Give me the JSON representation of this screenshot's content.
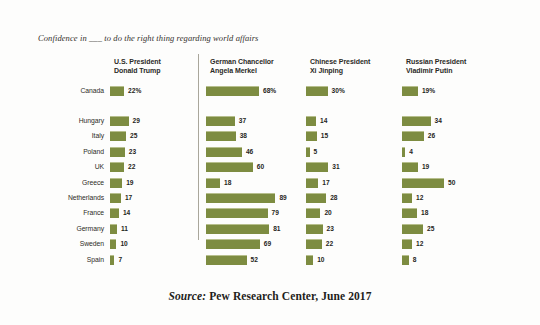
{
  "chart_data": {
    "type": "bar",
    "title": "Confidence in ___ to do the right thing regarding world affairs",
    "xlabel": "",
    "ylabel": "",
    "xlim": [
      0,
      100
    ],
    "grid": false,
    "orientation": "horizontal",
    "legend_position": "top (column headers)",
    "note": "Percent expressing confidence in each leader, by country. Values for Canada shown with % sign; remaining values are plain numbers.",
    "categories": [
      "Canada",
      "Hungary",
      "Italy",
      "Poland",
      "UK",
      "Greece",
      "Netherlands",
      "France",
      "Germany",
      "Sweden",
      "Spain"
    ],
    "series": [
      {
        "name": "U.S. President Donald Trump",
        "name_line1": "U.S. President",
        "name_line2": "Donald Trump",
        "values": [
          22,
          29,
          25,
          23,
          22,
          19,
          17,
          14,
          11,
          10,
          7
        ],
        "labels": [
          "22%",
          "29",
          "25",
          "23",
          "22",
          "19",
          "17",
          "14",
          "11",
          "10",
          "7"
        ]
      },
      {
        "name": "German Chancellor Angela Merkel",
        "name_line1": "German Chancellor",
        "name_line2": "Angela Merkel",
        "values": [
          68,
          37,
          38,
          46,
          60,
          18,
          89,
          79,
          81,
          69,
          52
        ],
        "labels": [
          "68%",
          "37",
          "38",
          "46",
          "60",
          "18",
          "89",
          "79",
          "81",
          "69",
          "52"
        ]
      },
      {
        "name": "Chinese President Xi Jinping",
        "name_line1": "Chinese President",
        "name_line2": "Xi Jinping",
        "values": [
          30,
          14,
          15,
          5,
          31,
          17,
          28,
          20,
          23,
          22,
          10
        ],
        "labels": [
          "30%",
          "14",
          "15",
          "5",
          "31",
          "17",
          "28",
          "20",
          "23",
          "22",
          "10"
        ]
      },
      {
        "name": "Russian President Vladimir Putin",
        "name_line1": "Russian President",
        "name_line2": "Vladimir Putin",
        "values": [
          19,
          34,
          26,
          4,
          19,
          50,
          12,
          18,
          25,
          12,
          8
        ],
        "labels": [
          "19%",
          "34",
          "26",
          "4",
          "19",
          "50",
          "12",
          "18",
          "25",
          "12",
          "8"
        ]
      }
    ]
  },
  "colors": {
    "bar": "#7d8c41",
    "bar_highlight": "#b7bf8d",
    "text": "#2e2c27",
    "divider": "#a9a69b",
    "background": "#fdfdfc"
  },
  "source": {
    "label": "Source:",
    "text": "Pew Research Center, June 2017"
  }
}
